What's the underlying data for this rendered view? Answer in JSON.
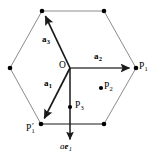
{
  "figure": {
    "kind": "hexagonal-lattice-vector-diagram",
    "width": 151,
    "height": 158,
    "background_color": "#ffffff",
    "outline_color": "#8c8c8c",
    "vector_color": "#1a1a1a",
    "point_color": "#000000"
  },
  "labels": {
    "origin": "O",
    "a1": "a",
    "a1_sub": "1",
    "a2": "a",
    "a2_sub": "2",
    "a3": "a",
    "a3_sub": "3",
    "p1": "P",
    "p1_sub": "1",
    "p1prime": "P",
    "p1prime_sub": "1",
    "p1prime_mark": "′",
    "p2": "P",
    "p2_sub": "2",
    "p3": "P",
    "p3_sub": "3",
    "axis_scalar": "a",
    "axis_basis": "e",
    "axis_basis_sub": "1"
  },
  "geometry": {
    "hexagon_vertices": [
      {
        "name": "top-left",
        "x": 42,
        "y": 11
      },
      {
        "name": "top-right",
        "x": 104,
        "y": 11
      },
      {
        "name": "right",
        "x": 136,
        "y": 68
      },
      {
        "name": "bottom-right",
        "x": 104,
        "y": 124
      },
      {
        "name": "bottom-left",
        "x": 41,
        "y": 124
      },
      {
        "name": "left",
        "x": 10,
        "y": 68
      }
    ],
    "origin_point": {
      "x": 70,
      "y": 68
    },
    "vectors": [
      {
        "name": "a3",
        "from": [
          70,
          68
        ],
        "to": [
          42,
          11
        ]
      },
      {
        "name": "a2",
        "from": [
          70,
          68
        ],
        "to": [
          136,
          68
        ]
      },
      {
        "name": "a1",
        "from": [
          70,
          68
        ],
        "to": [
          41,
          124
        ]
      },
      {
        "name": "ae1",
        "from": [
          70,
          68
        ],
        "to": [
          70,
          146
        ]
      }
    ],
    "marked_points": [
      {
        "name": "P1",
        "x": 136,
        "y": 68
      },
      {
        "name": "P1prime",
        "x": 41,
        "y": 124
      },
      {
        "name": "P2",
        "x": 101,
        "y": 88
      },
      {
        "name": "P3",
        "x": 70,
        "y": 107
      }
    ],
    "interior_segments": [
      {
        "from": [
          41,
          124
        ],
        "to": [
          104,
          124
        ]
      }
    ]
  }
}
